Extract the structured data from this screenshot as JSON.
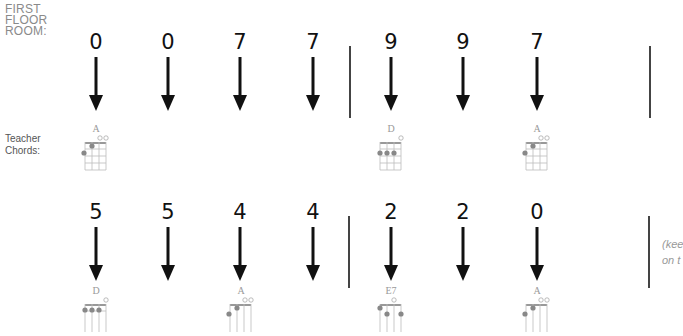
{
  "labels": {
    "room_line1": "FIRST",
    "room_line2": "FLOOR",
    "room_line3": "ROOM:",
    "teacher_line1": "Teacher",
    "teacher_line2": "Chords:"
  },
  "rows": [
    {
      "beats": [
        "0",
        "0",
        "7",
        "7",
        "9",
        "9",
        "7"
      ],
      "chords": [
        {
          "name": "A",
          "beat_index": 0
        },
        {
          "name": "D",
          "beat_index": 4
        },
        {
          "name": "A",
          "beat_index": 6
        }
      ]
    },
    {
      "beats": [
        "5",
        "5",
        "4",
        "4",
        "2",
        "2",
        "0"
      ],
      "chords": [
        {
          "name": "D",
          "beat_index": 0
        },
        {
          "name": "A",
          "beat_index": 2
        },
        {
          "name": "E7",
          "beat_index": 4
        },
        {
          "name": "A",
          "beat_index": 6
        }
      ]
    }
  ],
  "side_note": {
    "line1": "(kee",
    "line2": "on t"
  },
  "colors": {
    "arrow": "#111111",
    "bar": "#444444",
    "label": "#8a8a8a",
    "chord": "#9a9a9a"
  }
}
